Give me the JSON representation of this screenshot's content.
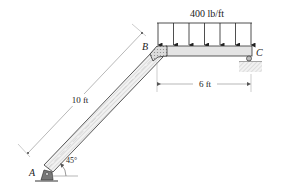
{
  "diagram": {
    "type": "structural-frame",
    "load": {
      "label": "400 lb/ft",
      "arrow_count": 7,
      "direction": "down"
    },
    "points": {
      "A": {
        "label": "A",
        "support": "pin"
      },
      "B": {
        "label": "B",
        "joint": "rigid"
      },
      "C": {
        "label": "C",
        "support": "roller"
      }
    },
    "members": [
      {
        "name": "AB",
        "length_label": "10 ft",
        "angle_label": "45°"
      },
      {
        "name": "BC",
        "length_label": "6 ft"
      }
    ],
    "colors": {
      "member_fill": "#e4e4e4",
      "joint_fill": "#d8d8d8",
      "line": "#333333",
      "dim_line": "#888888"
    }
  }
}
